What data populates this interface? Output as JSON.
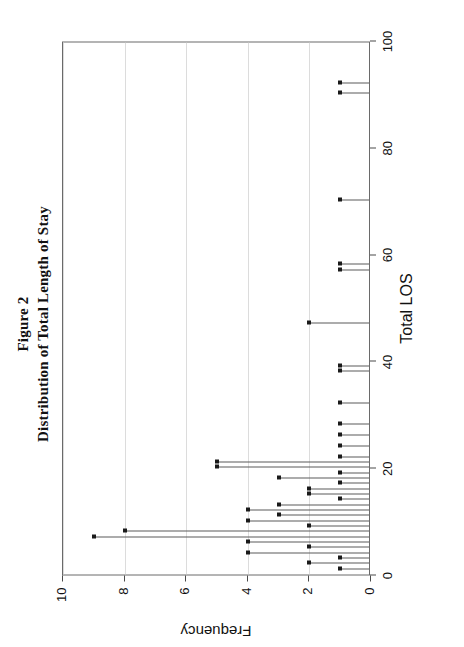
{
  "figure": {
    "title_line1": "Figure 2",
    "title_line2": "Distribution of Total Length of Stay",
    "rotation": "90deg counter-clockwise",
    "page_width": 464,
    "page_height": 647
  },
  "chart_data": {
    "type": "bar",
    "title": "Distribution of Total Length of Stay",
    "subtitle": "Figure 2",
    "xlabel": "Total LOS",
    "ylabel": "Frequency",
    "xlim": [
      0,
      100
    ],
    "ylim": [
      0,
      10
    ],
    "xticks": [
      0,
      20,
      40,
      60,
      80,
      100
    ],
    "yticks": [
      0,
      2,
      4,
      6,
      8,
      10
    ],
    "xtick_labels": [
      "0",
      "20",
      "40",
      "60",
      "80",
      "100"
    ],
    "ytick_labels": [
      "0",
      "2",
      "4",
      "6",
      "8",
      "10"
    ],
    "grid": "horizontal gridlines at each y tick",
    "legend": "none",
    "marker": "filled square at stem tip",
    "categories": [
      1,
      2,
      3,
      4,
      5,
      6,
      7,
      8,
      9,
      10,
      11,
      12,
      13,
      14,
      15,
      16,
      17,
      18,
      19,
      20,
      21,
      22,
      24,
      26,
      28,
      32,
      38,
      39,
      47,
      57,
      58,
      70,
      90,
      92
    ],
    "values": [
      1,
      2,
      1,
      4,
      2,
      4,
      9,
      8,
      2,
      4,
      3,
      4,
      3,
      1,
      2,
      2,
      1,
      3,
      1,
      5,
      5,
      1,
      1,
      1,
      1,
      1,
      1,
      1,
      2,
      1,
      1,
      1,
      1,
      1
    ],
    "points": [
      {
        "x": 1,
        "y": 1
      },
      {
        "x": 2,
        "y": 2
      },
      {
        "x": 3,
        "y": 1
      },
      {
        "x": 4,
        "y": 4
      },
      {
        "x": 5,
        "y": 2
      },
      {
        "x": 6,
        "y": 4
      },
      {
        "x": 7,
        "y": 9
      },
      {
        "x": 8,
        "y": 8
      },
      {
        "x": 9,
        "y": 2
      },
      {
        "x": 10,
        "y": 4
      },
      {
        "x": 11,
        "y": 3
      },
      {
        "x": 12,
        "y": 4
      },
      {
        "x": 13,
        "y": 3
      },
      {
        "x": 14,
        "y": 1
      },
      {
        "x": 15,
        "y": 2
      },
      {
        "x": 16,
        "y": 2
      },
      {
        "x": 17,
        "y": 1
      },
      {
        "x": 18,
        "y": 3
      },
      {
        "x": 19,
        "y": 1
      },
      {
        "x": 20,
        "y": 5
      },
      {
        "x": 21,
        "y": 5
      },
      {
        "x": 22,
        "y": 1
      },
      {
        "x": 24,
        "y": 1
      },
      {
        "x": 26,
        "y": 1
      },
      {
        "x": 28,
        "y": 1
      },
      {
        "x": 32,
        "y": 1
      },
      {
        "x": 38,
        "y": 1
      },
      {
        "x": 39,
        "y": 1
      },
      {
        "x": 47,
        "y": 2
      },
      {
        "x": 57,
        "y": 1
      },
      {
        "x": 58,
        "y": 1
      },
      {
        "x": 70,
        "y": 1
      },
      {
        "x": 90,
        "y": 1
      },
      {
        "x": 92,
        "y": 1
      }
    ],
    "colors": {
      "stem": "#5a5a5a",
      "marker": "#1a1a1a",
      "grid": "#dcdcdc",
      "frame": "#6a6a6a",
      "text": "#111111",
      "background": "#ffffff"
    }
  }
}
